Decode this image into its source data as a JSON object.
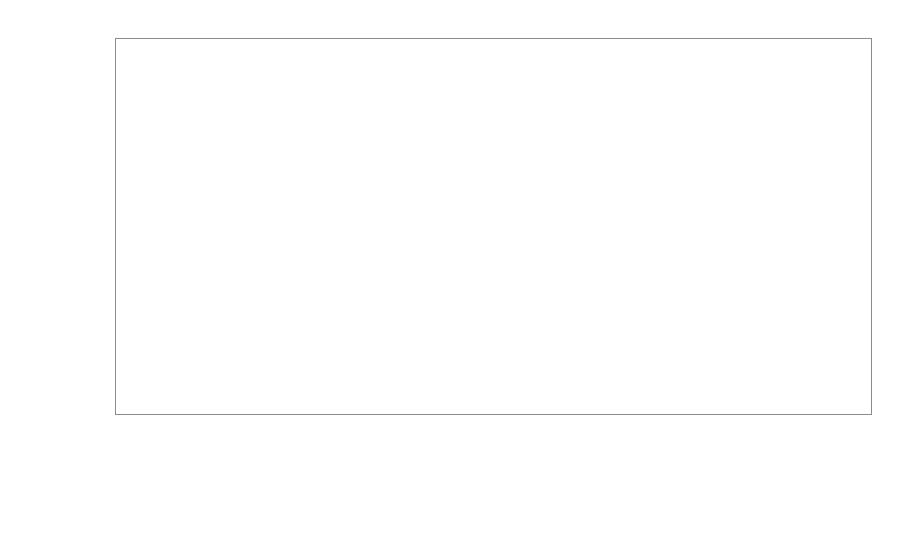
{
  "chart_data": {
    "type": "scatter",
    "title": "",
    "xlabel": "",
    "ylabel": "Full/partial shadow value",
    "ylim": [
      0,
      2.5
    ],
    "ytick_labels": [
      "0",
      "0,5",
      "1",
      "1,5",
      "2",
      "2,5"
    ],
    "ytick_values": [
      0,
      0.5,
      1,
      1.5,
      2,
      2.5
    ],
    "xtick_labels": [
      "1988",
      "1990",
      "1991"
    ],
    "grid": "horizontal",
    "legend_position": "bottom-center",
    "decimal_separator": ",",
    "series": [
      {
        "name": "Full",
        "marker": "diamond",
        "color": "#111111",
        "points": [
          {
            "group": "1988",
            "i": 0,
            "y": 0.82
          },
          {
            "group": "1988",
            "i": 1,
            "y": 0.9
          },
          {
            "group": "1988",
            "i": 2,
            "y": 1.95
          },
          {
            "group": "1988",
            "i": 3,
            "y": 1.17
          },
          {
            "group": "1988",
            "i": 4,
            "y": 1.27
          },
          {
            "group": "1988",
            "i": 5,
            "y": 1.38
          },
          {
            "group": "1988",
            "i": 6,
            "y": 2.08
          },
          {
            "group": "1988",
            "i": 7,
            "y": 0.81
          },
          {
            "group": "1988",
            "i": 8,
            "y": 1.31
          },
          {
            "group": "1988",
            "i": 9,
            "y": 1.32
          },
          {
            "group": "1988",
            "i": 10,
            "y": 0.87
          },
          {
            "group": "1988",
            "i": 11,
            "y": 0.84
          },
          {
            "group": "1988",
            "i": 12,
            "y": 0.57
          },
          {
            "group": "1988",
            "i": 13,
            "y": 1.31
          },
          {
            "group": "1988",
            "i": 14,
            "y": 0.91
          },
          {
            "group": "1988",
            "i": 15,
            "y": 1.12
          },
          {
            "group": "1990",
            "i": 0,
            "y": 1.57
          },
          {
            "group": "1990",
            "i": 1,
            "y": 1.32
          },
          {
            "group": "1990",
            "i": 2,
            "y": 1.1
          },
          {
            "group": "1990",
            "i": 3,
            "y": 1.92
          },
          {
            "group": "1990",
            "i": 4,
            "y": 1.93
          },
          {
            "group": "1990",
            "i": 5,
            "y": 1.87
          },
          {
            "group": "1990",
            "i": 6,
            "y": 1.91
          },
          {
            "group": "1990",
            "i": 7,
            "y": 1.42
          },
          {
            "group": "1990",
            "i": 8,
            "y": 1.25
          },
          {
            "group": "1990",
            "i": 9,
            "y": 1.76
          },
          {
            "group": "1990",
            "i": 10,
            "y": 1.51
          },
          {
            "group": "1990",
            "i": 11,
            "y": 1.48
          },
          {
            "group": "1990",
            "i": 12,
            "y": 1.22
          },
          {
            "group": "1990",
            "i": 13,
            "y": 2.05
          },
          {
            "group": "1990",
            "i": 14,
            "y": 1.3
          },
          {
            "group": "1990",
            "i": 15,
            "y": 1.9
          },
          {
            "group": "1990",
            "i": 16,
            "y": 1.68
          },
          {
            "group": "1990",
            "i": 17,
            "y": 1.44
          },
          {
            "group": "1990",
            "i": 18,
            "y": 1.12
          },
          {
            "group": "1990",
            "i": 19,
            "y": 1.72
          },
          {
            "group": "1990",
            "i": 20,
            "y": 0.9
          },
          {
            "group": "1990",
            "i": 21,
            "y": 0.9
          },
          {
            "group": "1991",
            "i": 0,
            "y": 1.54
          },
          {
            "group": "1991",
            "i": 1,
            "y": 1.53
          },
          {
            "group": "1991",
            "i": 2,
            "y": 2.17
          },
          {
            "group": "1991",
            "i": 3,
            "y": 2.09
          },
          {
            "group": "1991",
            "i": 4,
            "y": 2.2
          },
          {
            "group": "1991",
            "i": 5,
            "y": 2.0
          },
          {
            "group": "1991",
            "i": 6,
            "y": 1.71
          },
          {
            "group": "1991",
            "i": 7,
            "y": 1.59
          },
          {
            "group": "1991",
            "i": 8,
            "y": 1.56
          },
          {
            "group": "1991",
            "i": 9,
            "y": 1.6
          },
          {
            "group": "1991",
            "i": 10,
            "y": 1.84
          },
          {
            "group": "1991",
            "i": 11,
            "y": 1.92
          },
          {
            "group": "1991",
            "i": 12,
            "y": 1.58
          },
          {
            "group": "1991",
            "i": 13,
            "y": 1.39
          },
          {
            "group": "1991",
            "i": 14,
            "y": 1.57
          },
          {
            "group": "1991",
            "i": 15,
            "y": 1.88
          },
          {
            "group": "1991",
            "i": 16,
            "y": 1.65
          },
          {
            "group": "1991",
            "i": 17,
            "y": 1.12
          }
        ]
      },
      {
        "name": "Partial",
        "marker": "square",
        "color": "#9a9a9a",
        "points": [
          {
            "group": "1988",
            "i": 0,
            "y": 0.46
          },
          {
            "group": "1988",
            "i": 1,
            "y": 0.26
          },
          {
            "group": "1988",
            "i": 2,
            "y": 0.19
          },
          {
            "group": "1988",
            "i": 3,
            "y": 0.33
          },
          {
            "group": "1988",
            "i": 4,
            "y": 0.23
          },
          {
            "group": "1988",
            "i": 5,
            "y": 0.25
          },
          {
            "group": "1988",
            "i": 6,
            "y": 0.27
          },
          {
            "group": "1988",
            "i": 7,
            "y": 0.24
          },
          {
            "group": "1988",
            "i": 8,
            "y": 0.25
          },
          {
            "group": "1988",
            "i": 9,
            "y": 0.25
          },
          {
            "group": "1988",
            "i": 10,
            "y": 0.25
          },
          {
            "group": "1988",
            "i": 11,
            "y": 0.24
          },
          {
            "group": "1988",
            "i": 12,
            "y": 0.26
          },
          {
            "group": "1988",
            "i": 13,
            "y": 0.17
          },
          {
            "group": "1988",
            "i": 14,
            "y": 0.42
          },
          {
            "group": "1988",
            "i": 15,
            "y": 0.23
          },
          {
            "group": "1990",
            "i": 0,
            "y": 0.56
          },
          {
            "group": "1990",
            "i": 1,
            "y": 0.43
          },
          {
            "group": "1990",
            "i": 2,
            "y": 0.46
          },
          {
            "group": "1990",
            "i": 3,
            "y": 0.41
          },
          {
            "group": "1990",
            "i": 4,
            "y": 0.44
          },
          {
            "group": "1990",
            "i": 5,
            "y": 0.48
          },
          {
            "group": "1990",
            "i": 6,
            "y": 0.43
          },
          {
            "group": "1990",
            "i": 7,
            "y": 0.49
          },
          {
            "group": "1990",
            "i": 8,
            "y": 0.44
          },
          {
            "group": "1990",
            "i": 9,
            "y": 0.38
          },
          {
            "group": "1990",
            "i": 10,
            "y": 0.52
          },
          {
            "group": "1990",
            "i": 11,
            "y": 0.42
          },
          {
            "group": "1990",
            "i": 12,
            "y": 0.4
          },
          {
            "group": "1990",
            "i": 13,
            "y": 0.47
          },
          {
            "group": "1990",
            "i": 14,
            "y": 0.49
          },
          {
            "group": "1990",
            "i": 15,
            "y": 0.42
          },
          {
            "group": "1990",
            "i": 16,
            "y": 0.41
          },
          {
            "group": "1990",
            "i": 17,
            "y": 0.47
          },
          {
            "group": "1990",
            "i": 18,
            "y": 0.47
          },
          {
            "group": "1990",
            "i": 19,
            "y": 0.36
          },
          {
            "group": "1990",
            "i": 20,
            "y": 0.38
          },
          {
            "group": "1990",
            "i": 21,
            "y": 0.29
          },
          {
            "group": "1990",
            "i": 22,
            "y": 0.27
          },
          {
            "group": "1991",
            "i": 0,
            "y": 0.43
          },
          {
            "group": "1991",
            "i": 1,
            "y": 0.49
          },
          {
            "group": "1991",
            "i": 2,
            "y": 0.5
          },
          {
            "group": "1991",
            "i": 3,
            "y": 0.52
          },
          {
            "group": "1991",
            "i": 4,
            "y": 0.57
          },
          {
            "group": "1991",
            "i": 5,
            "y": 0.51
          },
          {
            "group": "1991",
            "i": 6,
            "y": 0.53
          },
          {
            "group": "1991",
            "i": 7,
            "y": 0.57
          },
          {
            "group": "1991",
            "i": 8,
            "y": 0.48
          },
          {
            "group": "1991",
            "i": 9,
            "y": 0.39
          },
          {
            "group": "1991",
            "i": 10,
            "y": 0.6
          },
          {
            "group": "1991",
            "i": 11,
            "y": 0.57
          },
          {
            "group": "1991",
            "i": 12,
            "y": 0.53
          },
          {
            "group": "1991",
            "i": 13,
            "y": 0.62
          },
          {
            "group": "1991",
            "i": 14,
            "y": 0.59
          },
          {
            "group": "1991",
            "i": 15,
            "y": 0.47
          }
        ]
      }
    ]
  },
  "axes": {
    "y_title": "Full/partial shadow value"
  },
  "legend": {
    "entries": [
      {
        "label": "Full",
        "marker": "diamond"
      },
      {
        "label": "Partial",
        "marker": "square"
      }
    ]
  }
}
